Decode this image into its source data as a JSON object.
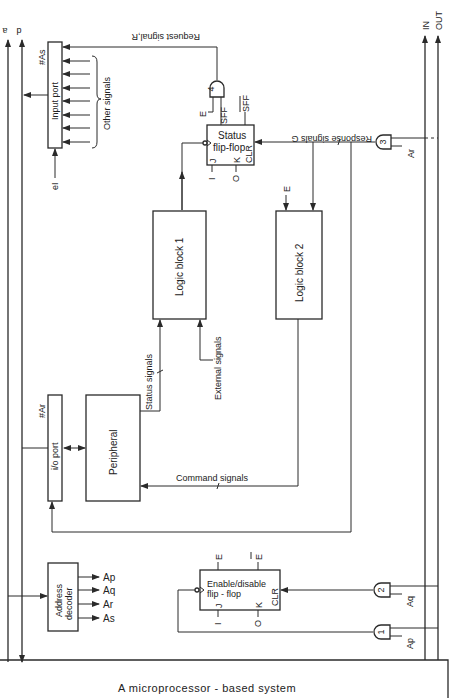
{
  "caption": "A microprocessor - based system",
  "bus_labels": {
    "a": "a",
    "d": "d",
    "in": "IN",
    "out": "OUT"
  },
  "blocks": {
    "input_port": "Input port",
    "input_port_addr": "#As",
    "io_port": "i/o port",
    "io_port_addr": "#Ar",
    "peripheral": "Peripheral",
    "logic_block_1": "Logic block 1",
    "logic_block_2": "Logic block 2",
    "status_ff_line1": "Status",
    "status_ff_line2": "flip-flop",
    "enable_ff_line1": "Enable/disable",
    "enable_ff_line2": "flip - flop",
    "address_decoder_line1": "Address",
    "address_decoder_line2": "decoder"
  },
  "signals": {
    "request": "Request signal,R",
    "response": "Response signals G",
    "other": "Other signals",
    "status": "Status signals",
    "external": "External signals",
    "command": "Command signals",
    "ei": "eI"
  },
  "ff_pins": {
    "j": "J",
    "k": "K",
    "clr": "CLR",
    "one": "I",
    "zero": "O",
    "e": "E",
    "ebar": "E",
    "sff": "SFF",
    "sffbar": "SFF"
  },
  "gates": {
    "g1": "1",
    "g2": "2",
    "g3": "3",
    "g4": "4"
  },
  "decoder_outputs": [
    "Ap",
    "Aq",
    "Ar",
    "As"
  ],
  "gate_inputs": {
    "g1": "Ap",
    "g2": "Aq",
    "g3": "Ar",
    "g4": "E"
  },
  "enable_labels": {
    "status_e": "E",
    "logic2_e": "E"
  }
}
